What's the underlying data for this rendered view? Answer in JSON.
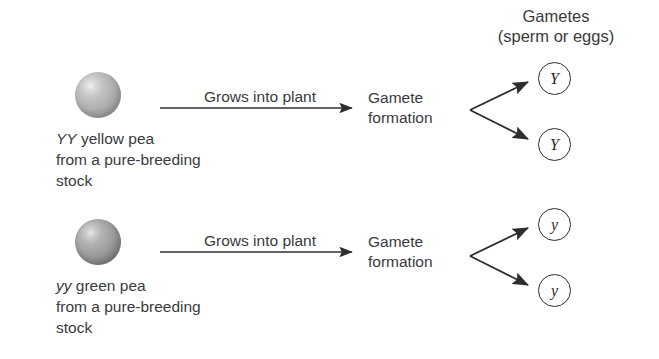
{
  "diagram": {
    "title_header": {
      "line1": "Gametes",
      "line2": "(sperm or eggs)"
    },
    "rows": [
      {
        "id": "yellow-pea-row",
        "pea_color_name": "gray-yellow-pea-sphere",
        "caption": {
          "genotype": "YY",
          "line1_rest": " yellow pea",
          "line2": "from a pure-breeding",
          "line3": "stock"
        },
        "process_label": "Grows into plant",
        "stage": {
          "line1": "Gamete",
          "line2": "formation"
        },
        "gametes": [
          "Y",
          "Y"
        ]
      },
      {
        "id": "green-pea-row",
        "pea_color_name": "gray-green-pea-sphere",
        "caption": {
          "genotype": "yy",
          "line1_rest": " green pea",
          "line2": "from a pure-breeding",
          "line3": "stock"
        },
        "process_label": "Grows into plant",
        "stage": {
          "line1": "Gamete",
          "line2": "formation"
        },
        "gametes": [
          "y",
          "y"
        ]
      }
    ],
    "colors": {
      "text": "#3a3a3c",
      "stroke": "#2d2d2f",
      "background": "#ffffff"
    }
  }
}
